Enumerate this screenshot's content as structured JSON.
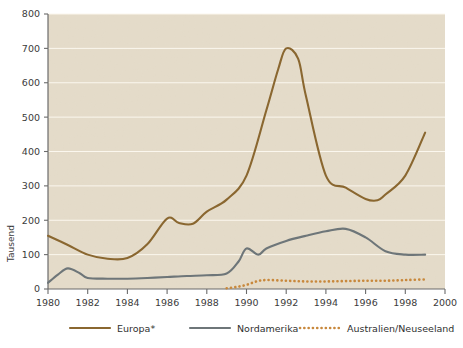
{
  "chart_data": {
    "type": "line",
    "title": "",
    "xlabel": "",
    "ylabel": "Tausend",
    "xlim": [
      1980,
      2000
    ],
    "ylim": [
      0,
      800
    ],
    "xticks": [
      "1980",
      "1982",
      "1984",
      "1986",
      "1988",
      "1990",
      "1992",
      "1994",
      "1996",
      "1998",
      "2000"
    ],
    "yticks": [
      "0",
      "100",
      "200",
      "300",
      "400",
      "500",
      "600",
      "700",
      "800"
    ],
    "grid": true,
    "legend_position": "bottom",
    "plot_background": "#ece4d4",
    "series": [
      {
        "name": "Europa*",
        "color": "#8a6730",
        "style": "solid",
        "x": [
          1980,
          1981,
          1982,
          1983,
          1984,
          1985,
          1986,
          1986.6,
          1987.3,
          1988,
          1989,
          1990,
          1991,
          1991.6,
          1992,
          1992.6,
          1993,
          1994,
          1995,
          1996,
          1996.6,
          1997,
          1998,
          1999
        ],
        "values": [
          155,
          128,
          100,
          88,
          90,
          130,
          205,
          192,
          190,
          225,
          260,
          330,
          520,
          640,
          700,
          670,
          560,
          330,
          295,
          262,
          258,
          275,
          330,
          455
        ]
      },
      {
        "name": "Nordamerika",
        "color": "#6e7679",
        "style": "solid",
        "x": [
          1980,
          1980.5,
          1981,
          1981.6,
          1982,
          1983,
          1984,
          1985,
          1986,
          1987,
          1988,
          1989,
          1989.6,
          1990,
          1990.6,
          1991,
          1992,
          1993,
          1994,
          1995,
          1996,
          1997,
          1998,
          1999
        ],
        "values": [
          18,
          42,
          60,
          46,
          32,
          30,
          30,
          32,
          35,
          38,
          40,
          45,
          80,
          118,
          100,
          118,
          140,
          155,
          168,
          175,
          150,
          110,
          100,
          100
        ]
      },
      {
        "name": "Australien/Neuseeland",
        "color": "#c8883c",
        "style": "dotted",
        "x": [
          1989,
          1989.5,
          1990,
          1990.5,
          1991,
          1992,
          1993,
          1994,
          1995,
          1996,
          1997,
          1998,
          1999
        ],
        "values": [
          2,
          6,
          12,
          22,
          26,
          24,
          22,
          22,
          23,
          24,
          24,
          26,
          28
        ]
      }
    ]
  },
  "axis": {
    "y_axis_title": "Tausend"
  },
  "legend": {
    "items": [
      {
        "label": "Europa*",
        "color": "#8a6730",
        "style": "solid"
      },
      {
        "label": "Nordamerika",
        "color": "#6e7679",
        "style": "solid"
      },
      {
        "label": "Australien/Neuseeland",
        "color": "#c8883c",
        "style": "dotted"
      }
    ]
  }
}
